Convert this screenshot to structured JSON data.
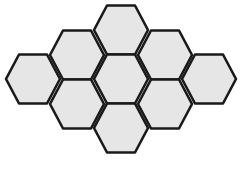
{
  "diagram": {
    "type": "hexagonal-tiling",
    "hex_count": 9,
    "orientation": "flat-top",
    "fill_color": "#e6e6e6",
    "stroke_color": "#1a1a1a",
    "hex_half_width": 27,
    "hex_half_height": 24.5,
    "hexagons": [
      {
        "id": "top",
        "cx": 121,
        "cy": 30
      },
      {
        "id": "upper-left",
        "cx": 77,
        "cy": 55
      },
      {
        "id": "upper-right",
        "cx": 165,
        "cy": 55
      },
      {
        "id": "middle-left",
        "cx": 33,
        "cy": 79
      },
      {
        "id": "center",
        "cx": 121,
        "cy": 79
      },
      {
        "id": "middle-right",
        "cx": 209,
        "cy": 79
      },
      {
        "id": "lower-left",
        "cx": 77,
        "cy": 104
      },
      {
        "id": "lower-right",
        "cx": 165,
        "cy": 104
      },
      {
        "id": "bottom",
        "cx": 121,
        "cy": 128
      }
    ]
  }
}
